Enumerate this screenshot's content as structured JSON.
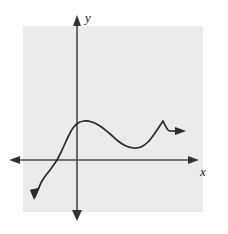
{
  "figure": {
    "background_color": "#ffffff",
    "panel_color": "#ebebeb",
    "ink_color": "#3a3a3a",
    "curve_color": "#2b2b2b"
  },
  "axes": {
    "x_axis": {
      "label": "x",
      "label_position": {
        "x": 200,
        "y": 176
      },
      "line": {
        "x1": 10,
        "y1": 160,
        "x2": 198,
        "y2": 160
      },
      "left_arrow": "arrow-left",
      "right_arrow": "arrow-right"
    },
    "y_axis": {
      "label": "y",
      "label_position": {
        "x": 85,
        "y": 22
      },
      "line": {
        "x1": 77,
        "y1": 16,
        "x2": 77,
        "y2": 220
      },
      "top_arrow": "arrow-up",
      "bottom_arrow": "arrow-down"
    },
    "origin": {
      "x": 77,
      "y": 160
    }
  },
  "panel": {
    "x": 23,
    "y": 26,
    "width": 180,
    "height": 186
  },
  "chart_data": {
    "type": "line",
    "title": "",
    "xlabel": "x",
    "ylabel": "y",
    "grid": false,
    "legend": null,
    "annotations": [
      {
        "name": "local-maximum",
        "x": 78,
        "y": 122
      },
      {
        "name": "local-minimum",
        "x": 136,
        "y": 148
      },
      {
        "name": "sharp-corner",
        "x": 163,
        "y": 121
      },
      {
        "name": "x-intercept",
        "x": 57,
        "y": 160
      }
    ],
    "series": [
      {
        "name": "curve",
        "arrow_start": "down-left",
        "arrow_end": "right",
        "points": [
          [
            35,
            197
          ],
          [
            42,
            181
          ],
          [
            50,
            170
          ],
          [
            57,
            160
          ],
          [
            63,
            148
          ],
          [
            68,
            137
          ],
          [
            73,
            128
          ],
          [
            78,
            123
          ],
          [
            84,
            121
          ],
          [
            92,
            122
          ],
          [
            100,
            126
          ],
          [
            109,
            133
          ],
          [
            118,
            141
          ],
          [
            126,
            146
          ],
          [
            134,
            148
          ],
          [
            141,
            147
          ],
          [
            148,
            142
          ],
          [
            155,
            133
          ],
          [
            163,
            121
          ],
          [
            168,
            130
          ],
          [
            173,
            131
          ],
          [
            178,
            131
          ]
        ]
      }
    ]
  }
}
